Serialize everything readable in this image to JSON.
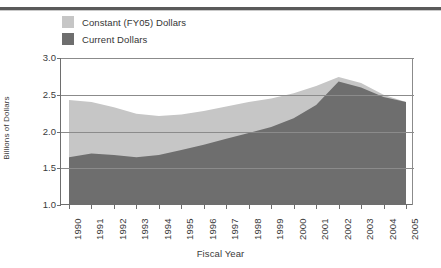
{
  "chart_data": {
    "type": "area",
    "title": "",
    "xlabel": "Fiscal Year",
    "ylabel": "Billions of Dollars",
    "ylim": [
      1.0,
      3.0
    ],
    "yticks": [
      "1.0",
      "1.5",
      "2.0",
      "2.5",
      "3.0"
    ],
    "ytick_values": [
      1.0,
      1.5,
      2.0,
      2.5,
      3.0
    ],
    "grid": true,
    "legend_position": "above-plot-left",
    "categories": [
      "1990",
      "1991",
      "1992",
      "1993",
      "1994",
      "1995",
      "1996",
      "1997",
      "1998",
      "1999",
      "2000",
      "2001",
      "2002",
      "2003",
      "2004",
      "2005"
    ],
    "x": [
      1990,
      1991,
      1992,
      1993,
      1994,
      1995,
      1996,
      1997,
      1998,
      1999,
      2000,
      2001,
      2002,
      2003,
      2004,
      2005
    ],
    "series": [
      {
        "name": "Constant (FY05) Dollars",
        "color": "#c6c6c6",
        "values": [
          2.43,
          2.4,
          2.33,
          2.24,
          2.21,
          2.23,
          2.28,
          2.34,
          2.4,
          2.45,
          2.52,
          2.62,
          2.74,
          2.66,
          2.5,
          2.4
        ]
      },
      {
        "name": "Current Dollars",
        "color": "#6e6e6e",
        "values": [
          1.65,
          1.7,
          1.68,
          1.65,
          1.68,
          1.75,
          1.82,
          1.9,
          1.98,
          2.06,
          2.18,
          2.36,
          2.68,
          2.6,
          2.47,
          2.4
        ]
      }
    ]
  },
  "legend": {
    "items": [
      {
        "label": "Constant (FY05) Dollars",
        "color": "#c6c6c6"
      },
      {
        "label": "Current Dollars",
        "color": "#6e6e6e"
      }
    ]
  },
  "axes": {
    "y_title": "Billions of Dollars",
    "x_title": "Fiscal Year"
  }
}
